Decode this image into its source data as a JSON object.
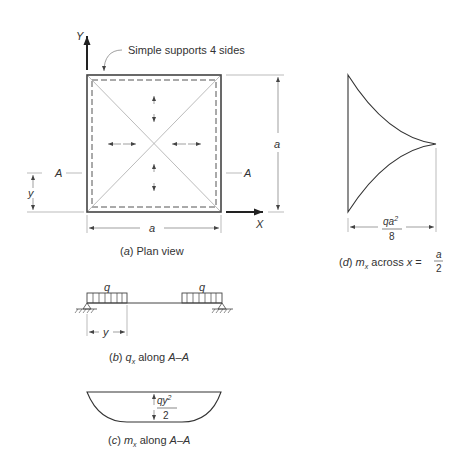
{
  "figure": {
    "panel_a": {
      "caption_letter": "a",
      "caption_text": " Plan view",
      "annotation": "Simple supports 4 sides",
      "y_axis_label": "Y",
      "x_axis_label": "X",
      "section_label_left": "A",
      "section_label_right": "A",
      "dim_width": "a",
      "dim_height": "a",
      "dim_y": "y"
    },
    "panel_b": {
      "caption_letter": "b",
      "caption_symbol": "q",
      "caption_subscript": "x",
      "caption_text": " along ",
      "caption_section": "A–A",
      "load_label_left": "q",
      "load_label_right": "q",
      "dim_y": "y"
    },
    "panel_c": {
      "caption_letter": "c",
      "caption_symbol": "m",
      "caption_subscript": "x",
      "caption_text": " along ",
      "caption_section": "A–A",
      "moment_numerator": "qy",
      "moment_exp": "2",
      "moment_denominator": "2"
    },
    "panel_d": {
      "caption_letter": "d",
      "caption_symbol": "m",
      "caption_subscript": "x",
      "caption_text": " across ",
      "caption_var": "x",
      "caption_eq": " = ",
      "caption_frac_num": "a",
      "caption_frac_den": "2",
      "moment_numerator": "qa",
      "moment_exp": "2",
      "moment_denominator": "8"
    }
  }
}
